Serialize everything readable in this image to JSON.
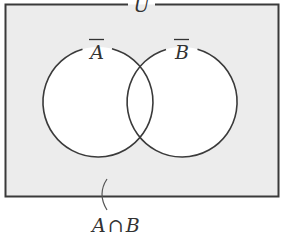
{
  "diagram": {
    "type": "venn",
    "universe_label": "U",
    "sets": [
      {
        "name": "A",
        "label": "A",
        "overbar": true
      },
      {
        "name": "B",
        "label": "B",
        "overbar": true
      }
    ],
    "shaded_region_label": "A∩B",
    "shaded_region_label_parts": {
      "left": "A",
      "op": "∩",
      "right": "B"
    },
    "colors": {
      "shaded": "#ececec",
      "circle_fill": "#ffffff",
      "stroke": "#3a3a3a",
      "text": "#333333"
    }
  }
}
